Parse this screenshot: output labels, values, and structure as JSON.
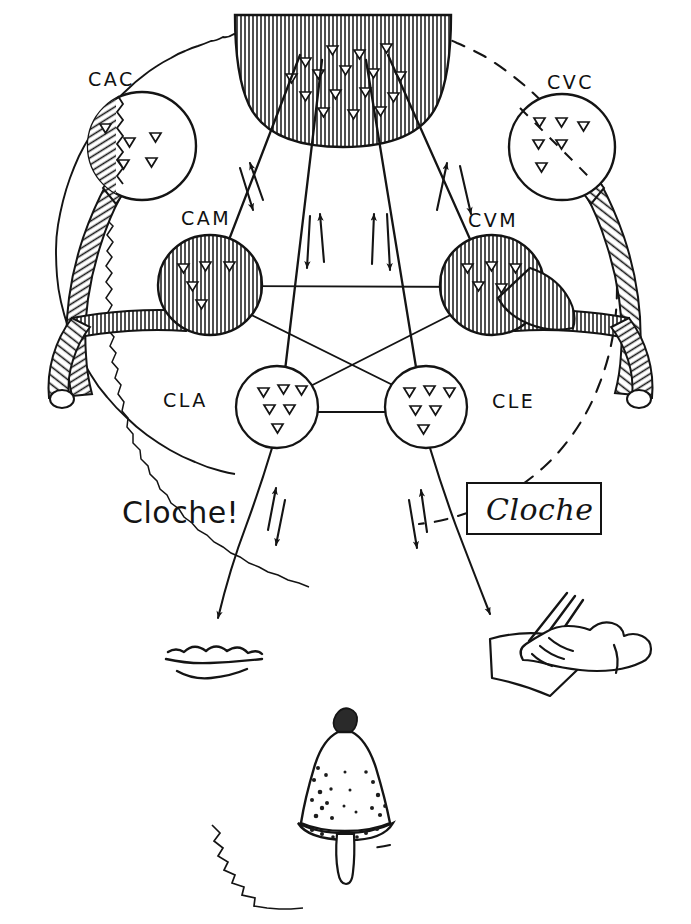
{
  "figure": {
    "head_outline": {
      "left_edge_style": "wavy-solid",
      "right_edge_style": "dashed",
      "ink_color": "#111111",
      "background_color": "#ffffff"
    },
    "top_region": {
      "name": "hatched-cortical-region",
      "description": "dense vertically hatched cortical area at vertex"
    }
  },
  "centres": [
    {
      "id": "CAC",
      "label": "CAC",
      "name": "centre-auditif-commun",
      "cx": 142,
      "cy": 146,
      "r": 54,
      "hatched": "partial-left",
      "cells": 5
    },
    {
      "id": "CVC",
      "label": "CVC",
      "name": "centre-visuel-commun",
      "cx": 562,
      "cy": 147,
      "r": 53,
      "hatched": "none",
      "cells": 6
    },
    {
      "id": "CAM",
      "label": "CAM",
      "name": "centre-auditif-des-mots",
      "cx": 210,
      "cy": 285,
      "r": 50,
      "hatched": "full",
      "cells": 5
    },
    {
      "id": "CVM",
      "label": "CVM",
      "name": "centre-visuel-des-mots",
      "cx": 492,
      "cy": 285,
      "r": 50,
      "hatched": "full",
      "cells": 5
    },
    {
      "id": "CLA",
      "label": "CLA",
      "name": "centre-du-langage-articule",
      "cx": 277,
      "cy": 407,
      "r": 41,
      "hatched": "none",
      "cells": 6
    },
    {
      "id": "CLE",
      "label": "CLE",
      "name": "centre-du-langage-ecrit",
      "cx": 426,
      "cy": 407,
      "r": 41,
      "hatched": "none",
      "cells": 6
    }
  ],
  "centre_label_positions": [
    {
      "id": "CAC",
      "x": 88,
      "y": 68
    },
    {
      "id": "CVC",
      "x": 547,
      "y": 71
    },
    {
      "id": "CAM",
      "x": 181,
      "y": 207
    },
    {
      "id": "CVM",
      "x": 468,
      "y": 209
    },
    {
      "id": "CLA",
      "x": 163,
      "y": 389
    },
    {
      "id": "CLE",
      "x": 492,
      "y": 390
    }
  ],
  "connections": [
    {
      "from": "TOP",
      "to": "CAM",
      "arrows": "bidirectional"
    },
    {
      "from": "TOP",
      "to": "CVM",
      "arrows": "bidirectional"
    },
    {
      "from": "TOP",
      "to": "CLA",
      "arrows": "bidirectional"
    },
    {
      "from": "TOP",
      "to": "CLE",
      "arrows": "bidirectional"
    },
    {
      "from": "CAM",
      "to": "CVM",
      "arrows": "none"
    },
    {
      "from": "CAM",
      "to": "CLE",
      "arrows": "none"
    },
    {
      "from": "CVM",
      "to": "CLA",
      "arrows": "none"
    },
    {
      "from": "CLA",
      "to": "CLE",
      "arrows": "none"
    },
    {
      "from": "CLA",
      "to": "MOUTH",
      "arrows": "bidirectional"
    },
    {
      "from": "CLE",
      "to": "HAND",
      "arrows": "bidirectional"
    }
  ],
  "annotations": {
    "spoken_word": "Cloche!",
    "written_word": "Cloche",
    "written_word_boxed": true
  },
  "icons": [
    {
      "name": "mouth-lips-icon",
      "meaning": "speech output",
      "x": 215,
      "y": 660
    },
    {
      "name": "writing-hand-icon",
      "meaning": "writing output",
      "x": 545,
      "y": 655
    },
    {
      "name": "bell-icon",
      "meaning": "cloche (bell) object",
      "x": 345,
      "y": 795
    }
  ],
  "caption": {
    "text": ""
  }
}
